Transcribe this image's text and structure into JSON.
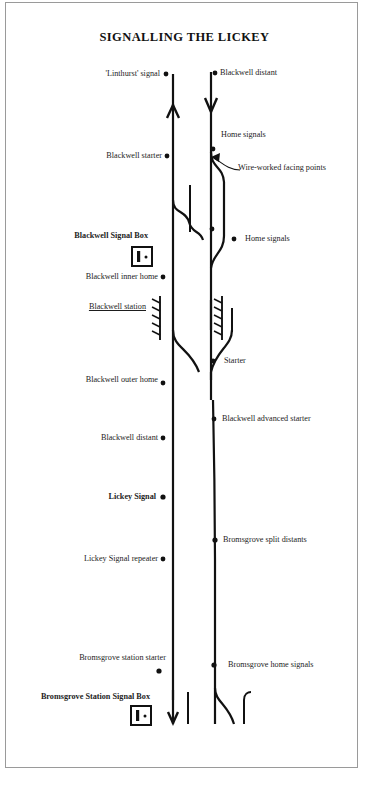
{
  "document": {
    "title": "SIGNALLING THE LICKEY",
    "frame_color": "#9a9a9a",
    "ink_color": "#111111",
    "paper_color": "#ffffff"
  },
  "diagram": {
    "type": "railway-signalling-schematic",
    "lines": [
      {
        "name": "up-line",
        "direction": "up",
        "arrow": "north"
      },
      {
        "name": "down-line",
        "direction": "down",
        "arrow": "south"
      }
    ],
    "labels": {
      "linthurst_signal": "'Linthurst' signal",
      "blackwell_distant_top": "Blackwell distant",
      "home_signals_upper": "Home signals",
      "blackwell_starter": "Blackwell starter",
      "wire_worked_facing_points": "Wire-worked facing points",
      "blackwell_signal_box": "Blackwell Signal Box",
      "home_signals_lower": "Home signals",
      "blackwell_inner_home": "Blackwell inner home",
      "blackwell_station": "Blackwell station",
      "starter": "Starter",
      "blackwell_outer_home": "Blackwell outer home",
      "blackwell_advanced_starter": "Blackwell advanced starter",
      "blackwell_distant_lower": "Blackwell distant",
      "lickey_signal": "Lickey Signal",
      "bromsgrove_split_distants": "Bromsgrove split distants",
      "lickey_signal_repeater": "Lickey Signal repeater",
      "bromsgrove_station_starter": "Bromsgrove station starter",
      "bromsgrove_home_signals": "Bromsgrove home signals",
      "bromsgrove_station_signal_box": "Bromsgrove Station Signal Box"
    },
    "signal_boxes": [
      {
        "name": "Blackwell Signal Box"
      },
      {
        "name": "Bromsgrove Station Signal Box"
      }
    ],
    "platforms": [
      {
        "name": "Blackwell up platform"
      },
      {
        "name": "Blackwell down platform"
      }
    ]
  }
}
